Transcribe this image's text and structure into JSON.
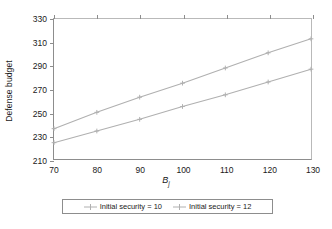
{
  "chart_data": {
    "type": "line",
    "title": "",
    "xlabel": "Bj",
    "xlabel_base": "B",
    "xlabel_sub": "j",
    "ylabel": "Defense budget",
    "x": [
      70,
      80,
      90,
      100,
      110,
      120,
      130
    ],
    "xlim": [
      70,
      130
    ],
    "ylim": [
      210,
      330
    ],
    "xticks": [
      70,
      80,
      90,
      100,
      110,
      120,
      130
    ],
    "yticks": [
      210,
      230,
      250,
      270,
      290,
      310,
      330
    ],
    "grid": false,
    "legend_position": "bottom-center",
    "series": [
      {
        "name": "Initial security = 12",
        "color": "#b0b0b0",
        "marker": "plus",
        "values": [
          236,
          250,
          263,
          275,
          288,
          301,
          313
        ]
      },
      {
        "name": "Initial security = 10",
        "color": "#b0b0b0",
        "marker": "plus",
        "values": [
          224,
          234,
          244,
          255,
          265,
          276,
          287
        ]
      }
    ]
  },
  "legend": {
    "entries": [
      {
        "label": "Initial security = 10"
      },
      {
        "label": "Initial security = 12"
      }
    ]
  },
  "colors": {
    "line": "#b0b0b0",
    "axis": "#8d8d8d",
    "text": "#1a1a1a",
    "background": "#ffffff"
  }
}
